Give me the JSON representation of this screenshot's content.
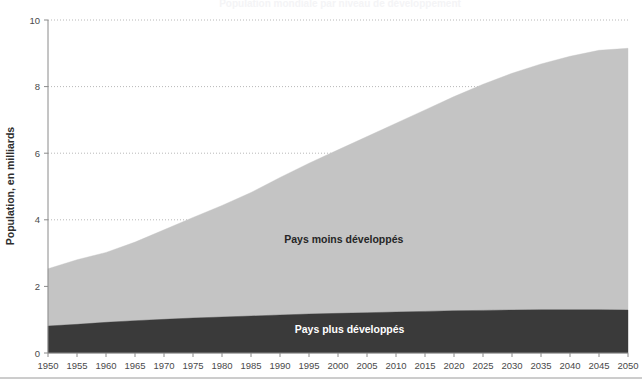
{
  "chart_data": {
    "type": "area",
    "title": "Population mondiale par niveau de développement",
    "xlabel": "",
    "ylabel": "Population, en milliards",
    "xlim": [
      1950,
      2050
    ],
    "ylim": [
      0,
      10
    ],
    "ytick_step": 2,
    "xtick_step": 5,
    "grid": true,
    "grid_style": "dotted-horizontal",
    "stacked": true,
    "legend_position": "in-plot-annotations",
    "x": [
      1950,
      1955,
      1960,
      1965,
      1970,
      1975,
      1980,
      1985,
      1990,
      1995,
      2000,
      2005,
      2010,
      2015,
      2020,
      2025,
      2030,
      2035,
      2040,
      2045,
      2050
    ],
    "yticks": [
      0,
      2,
      4,
      6,
      8,
      10
    ],
    "ytick_labels": [
      "0",
      "2",
      "4",
      "6",
      "8",
      "10"
    ],
    "xtick_labels": [
      "1950",
      "1955",
      "1960",
      "1965",
      "1970",
      "1975",
      "1980",
      "1985",
      "1990",
      "1995",
      "2000",
      "2005",
      "2010",
      "2015",
      "2020",
      "2025",
      "2030",
      "2035",
      "2040",
      "2045",
      "2050"
    ],
    "series": [
      {
        "name": "Pays plus développés",
        "color": "#3a3a3a",
        "label_text_color": "#ffffff",
        "label_x": 2002,
        "label_y": 0.6,
        "values": [
          0.81,
          0.86,
          0.92,
          0.97,
          1.01,
          1.05,
          1.08,
          1.11,
          1.14,
          1.17,
          1.19,
          1.21,
          1.23,
          1.25,
          1.27,
          1.28,
          1.29,
          1.3,
          1.3,
          1.3,
          1.29
        ]
      },
      {
        "name": "Pays moins développés",
        "color": "#c4c4c4",
        "label_text_color": "#262626",
        "label_x": 2001,
        "label_y": 3.3,
        "values": [
          1.72,
          1.94,
          2.1,
          2.36,
          2.69,
          3.02,
          3.35,
          3.71,
          4.13,
          4.53,
          4.91,
          5.29,
          5.67,
          6.05,
          6.43,
          6.79,
          7.11,
          7.38,
          7.61,
          7.79,
          7.86
        ]
      }
    ],
    "totals": [
      2.53,
      2.8,
      3.02,
      3.33,
      3.7,
      4.07,
      4.43,
      4.82,
      5.27,
      5.7,
      6.1,
      6.5,
      6.9,
      7.3,
      7.7,
      8.07,
      8.4,
      8.68,
      8.91,
      9.09,
      9.15
    ]
  },
  "colors": {
    "background": "#ffffff",
    "axis": "#8a8a8a",
    "grid": "#b8b8b8",
    "text": "#4a4a4a",
    "series_more_developed": "#3a3a3a",
    "series_less_developed": "#c4c4c4"
  }
}
